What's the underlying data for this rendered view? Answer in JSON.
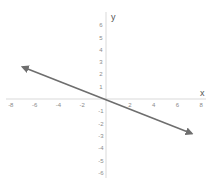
{
  "chart_data": {
    "type": "line",
    "title": "",
    "xlabel": "x",
    "ylabel": "y",
    "xlim": [
      -8,
      8
    ],
    "ylim": [
      -6,
      6
    ],
    "x_ticks": [
      -8,
      -6,
      -4,
      -2,
      2,
      4,
      6,
      8
    ],
    "y_ticks": [
      6,
      5,
      4,
      3,
      2,
      1,
      -1,
      -2,
      -3,
      -4,
      -5,
      -6
    ],
    "grid": false,
    "legend": null,
    "series": [
      {
        "name": "line",
        "slope": -0.375,
        "intercept": 0,
        "x": [
          -7,
          7.2
        ],
        "y": [
          2.6,
          -2.8
        ],
        "arrows": "both",
        "color": "#6e6e6e"
      }
    ]
  },
  "colors": {
    "axis": "#cfcfcf",
    "line": "#6e6e6e",
    "tick_text": "#8a8a8a",
    "background": "#ffffff"
  }
}
